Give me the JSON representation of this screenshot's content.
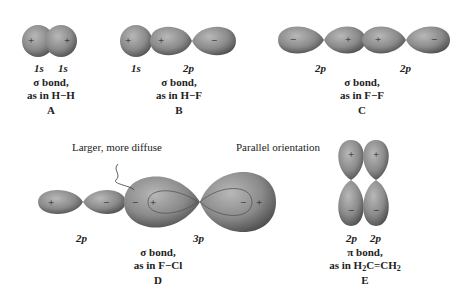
{
  "panels": [
    {
      "id": "A",
      "orbitals": [
        "1s",
        "1s"
      ],
      "bond": "σ bond,",
      "example": "as in H−H",
      "letter": "A"
    },
    {
      "id": "B",
      "orbitals": [
        "1s",
        "2p"
      ],
      "bond": "σ bond,",
      "example": "as in H−F",
      "letter": "B"
    },
    {
      "id": "C",
      "orbitals": [
        "2p",
        "2p"
      ],
      "bond": "σ bond,",
      "example": "as in F−F",
      "letter": "C"
    },
    {
      "id": "D",
      "orbitals": [
        "2p",
        "3p"
      ],
      "bond": "σ bond,",
      "example": "as in F−Cl",
      "letter": "D",
      "annotation": "Larger, more diffuse"
    },
    {
      "id": "E",
      "orbitals": [
        "2p",
        "2p"
      ],
      "bond": "π bond,",
      "example_parts": [
        "as in H",
        "2",
        "C=CH",
        "2"
      ],
      "letter": "E",
      "annotation": "Parallel orientation"
    }
  ],
  "signs": {
    "plus": "+",
    "minus": "−"
  },
  "colors": {
    "lobe": "#8a8a8a",
    "lobe_dark": "#555555",
    "lobe_light": "#b5b5b5",
    "text": "#222222"
  }
}
